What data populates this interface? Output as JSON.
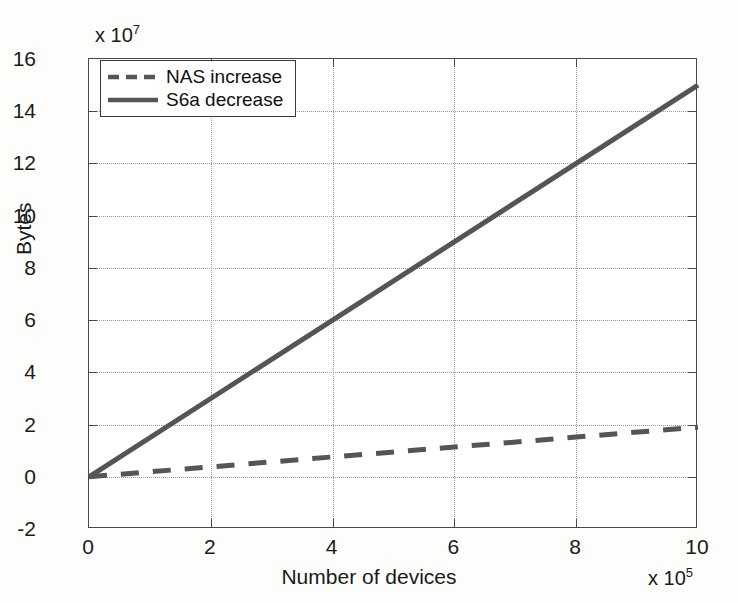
{
  "chart_data": {
    "type": "line",
    "title": "",
    "xlabel": "Number of devices",
    "ylabel": "Bytes",
    "x_exponent_label": "x 10",
    "x_exponent_power": "5",
    "y_exponent_label": "x 10",
    "y_exponent_power": "7",
    "xlim": [
      0,
      10
    ],
    "ylim": [
      -2,
      16
    ],
    "xticks": [
      "0",
      "2",
      "4",
      "6",
      "8",
      "10"
    ],
    "xtick_values": [
      0,
      2,
      4,
      6,
      8,
      10
    ],
    "yticks": [
      "-2",
      "0",
      "2",
      "4",
      "6",
      "8",
      "10",
      "12",
      "14",
      "16"
    ],
    "ytick_values": [
      -2,
      0,
      2,
      4,
      6,
      8,
      10,
      12,
      14,
      16
    ],
    "grid": true,
    "grid_style": "dotted",
    "legend_position": "upper left",
    "x": [
      0,
      10
    ],
    "series": [
      {
        "name": "NAS increase",
        "style": "dashed",
        "color": "#555555",
        "values": [
          0,
          1.9
        ]
      },
      {
        "name": "S6a decrease",
        "style": "solid",
        "color": "#555555",
        "values": [
          0,
          15.0
        ]
      }
    ]
  },
  "legend": {
    "items": [
      {
        "label": "NAS increase",
        "style": "dashed"
      },
      {
        "label": "S6a decrease",
        "style": "solid"
      }
    ]
  },
  "axes": {
    "x_title": "Number of devices",
    "y_title": "Bytes"
  },
  "colors": {
    "line": "#555555",
    "axis": "#4a4a4a",
    "grid": "#9a9a9a",
    "background": "#fdfdfc",
    "plot_background": "#ffffff",
    "text": "#1a1a1a"
  }
}
